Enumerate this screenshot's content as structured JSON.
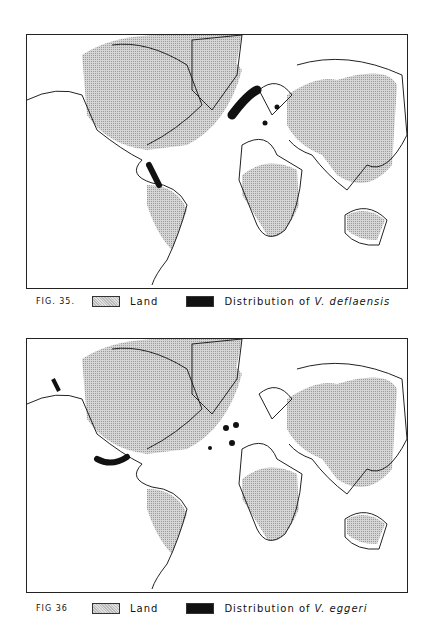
{
  "figures": [
    {
      "number": "FIG. 35.",
      "legend": {
        "land": "Land",
        "distribution_prefix": "Distribution of",
        "species": "V. deflaensis"
      }
    },
    {
      "number": "FIG 36",
      "legend": {
        "land": "Land",
        "distribution_prefix": "Distribution of",
        "species": "V. eggeri"
      }
    }
  ],
  "colors": {
    "land": "#c8c8c8",
    "distribution": "#111111",
    "outline": "#222222"
  }
}
